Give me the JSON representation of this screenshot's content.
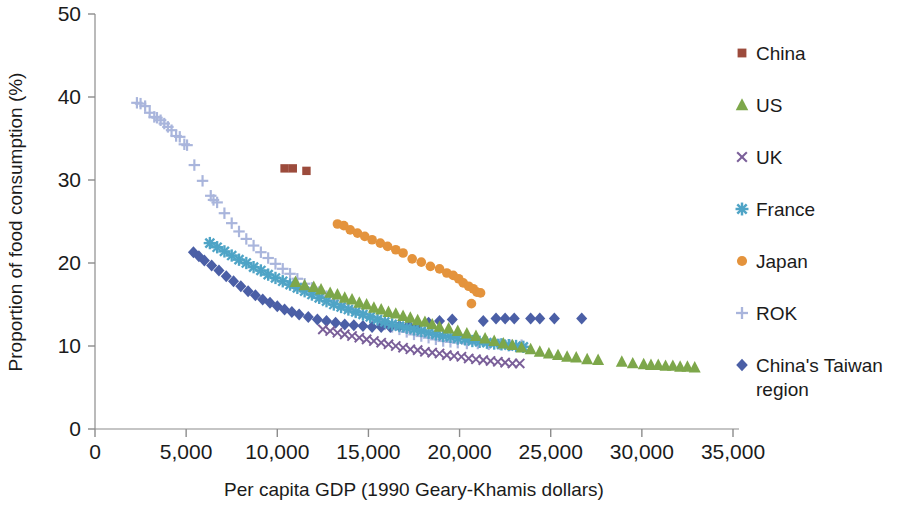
{
  "chart_data": {
    "type": "scatter",
    "title": "",
    "xlabel": "Per capita GDP (1990 Geary-Khamis dollars)",
    "ylabel": "Proportion of food consumption (%)",
    "xlim": [
      0,
      35000
    ],
    "ylim": [
      0,
      50
    ],
    "xticks": [
      0,
      5000,
      10000,
      15000,
      20000,
      25000,
      30000,
      35000
    ],
    "xtick_labels": [
      "0",
      "5,000",
      "10,000",
      "15,000",
      "20,000",
      "25,000",
      "30,000",
      "35,000"
    ],
    "yticks": [
      0,
      10,
      20,
      30,
      40,
      50
    ],
    "ytick_labels": [
      "0",
      "10",
      "20",
      "30",
      "40",
      "50"
    ],
    "grid": false,
    "legend_position": "right",
    "series": [
      {
        "name": "China",
        "marker": "square",
        "color": "#9C4B3C",
        "points": [
          [
            10400,
            31.4
          ],
          [
            10850,
            31.4
          ],
          [
            11600,
            31.1
          ]
        ]
      },
      {
        "name": "US",
        "marker": "triangle",
        "color": "#7DA74A",
        "points": [
          [
            11000,
            17.7
          ],
          [
            11500,
            17.3
          ],
          [
            12000,
            17.1
          ],
          [
            12400,
            16.8
          ],
          [
            12900,
            16.4
          ],
          [
            13300,
            16.2
          ],
          [
            13700,
            15.8
          ],
          [
            14100,
            15.6
          ],
          [
            14500,
            15.2
          ],
          [
            14900,
            15.0
          ],
          [
            15300,
            14.6
          ],
          [
            15700,
            14.4
          ],
          [
            16100,
            14.1
          ],
          [
            16500,
            13.9
          ],
          [
            16900,
            13.6
          ],
          [
            17300,
            13.4
          ],
          [
            17700,
            13.1
          ],
          [
            18100,
            12.9
          ],
          [
            18500,
            12.6
          ],
          [
            18900,
            12.3
          ],
          [
            19400,
            12.1
          ],
          [
            19900,
            11.8
          ],
          [
            20400,
            11.5
          ],
          [
            20900,
            11.2
          ],
          [
            21400,
            10.9
          ],
          [
            21900,
            10.6
          ],
          [
            22400,
            10.3
          ],
          [
            22900,
            10.1
          ],
          [
            23400,
            9.8
          ],
          [
            23900,
            9.6
          ],
          [
            24400,
            9.3
          ],
          [
            24900,
            9.1
          ],
          [
            25400,
            8.9
          ],
          [
            25900,
            8.7
          ],
          [
            26400,
            8.6
          ],
          [
            27000,
            8.4
          ],
          [
            27600,
            8.3
          ],
          [
            28900,
            8.1
          ],
          [
            29500,
            7.9
          ],
          [
            30100,
            7.8
          ],
          [
            30500,
            7.7
          ],
          [
            30900,
            7.7
          ],
          [
            31300,
            7.6
          ],
          [
            31700,
            7.6
          ],
          [
            32100,
            7.5
          ],
          [
            32500,
            7.5
          ],
          [
            32900,
            7.4
          ]
        ]
      },
      {
        "name": "UK",
        "marker": "cross",
        "color": "#7A5F99",
        "points": [
          [
            12500,
            12.0
          ],
          [
            12900,
            11.8
          ],
          [
            13300,
            11.6
          ],
          [
            13700,
            11.4
          ],
          [
            14100,
            11.2
          ],
          [
            14500,
            11.0
          ],
          [
            14900,
            10.8
          ],
          [
            15300,
            10.6
          ],
          [
            15700,
            10.4
          ],
          [
            16100,
            10.2
          ],
          [
            16500,
            10.0
          ],
          [
            16900,
            9.8
          ],
          [
            17300,
            9.6
          ],
          [
            17700,
            9.5
          ],
          [
            18100,
            9.3
          ],
          [
            18500,
            9.2
          ],
          [
            18900,
            9.1
          ],
          [
            19300,
            8.9
          ],
          [
            19700,
            8.8
          ],
          [
            20100,
            8.7
          ],
          [
            20500,
            8.5
          ],
          [
            20900,
            8.4
          ],
          [
            21300,
            8.3
          ],
          [
            21700,
            8.2
          ],
          [
            22100,
            8.1
          ],
          [
            22500,
            8.0
          ],
          [
            22900,
            7.9
          ],
          [
            23300,
            7.9
          ]
        ]
      },
      {
        "name": "France",
        "marker": "asterisk",
        "color": "#4FA4C6",
        "points": [
          [
            6300,
            22.4
          ],
          [
            6700,
            21.9
          ],
          [
            7100,
            21.4
          ],
          [
            7500,
            20.9
          ],
          [
            7900,
            20.4
          ],
          [
            8300,
            20.0
          ],
          [
            8700,
            19.5
          ],
          [
            9100,
            19.1
          ],
          [
            9500,
            18.6
          ],
          [
            9900,
            18.2
          ],
          [
            10300,
            17.8
          ],
          [
            10700,
            17.4
          ],
          [
            11100,
            17.0
          ],
          [
            11500,
            16.6
          ],
          [
            11900,
            16.2
          ],
          [
            12300,
            15.8
          ],
          [
            12700,
            15.4
          ],
          [
            13100,
            15.0
          ],
          [
            13500,
            14.7
          ],
          [
            13900,
            14.4
          ],
          [
            14300,
            14.1
          ],
          [
            14700,
            13.8
          ],
          [
            15100,
            13.5
          ],
          [
            15500,
            13.2
          ],
          [
            15900,
            12.9
          ],
          [
            16300,
            12.6
          ],
          [
            16700,
            12.4
          ],
          [
            17100,
            12.2
          ],
          [
            17500,
            12.0
          ],
          [
            17900,
            11.8
          ],
          [
            18300,
            11.6
          ],
          [
            18700,
            11.4
          ],
          [
            19100,
            11.2
          ],
          [
            19500,
            11.1
          ],
          [
            19900,
            10.9
          ],
          [
            20300,
            10.8
          ],
          [
            20700,
            10.6
          ],
          [
            21100,
            10.5
          ],
          [
            21500,
            10.4
          ],
          [
            21900,
            10.3
          ],
          [
            22300,
            10.2
          ],
          [
            22700,
            10.1
          ],
          [
            23100,
            10.0
          ],
          [
            23500,
            9.9
          ]
        ]
      },
      {
        "name": "Japan",
        "marker": "circle",
        "color": "#E4933C",
        "points": [
          [
            13300,
            24.7
          ],
          [
            13650,
            24.5
          ],
          [
            14000,
            24.0
          ],
          [
            14400,
            23.6
          ],
          [
            14800,
            23.2
          ],
          [
            15200,
            22.8
          ],
          [
            15650,
            22.4
          ],
          [
            16050,
            22.0
          ],
          [
            16500,
            21.6
          ],
          [
            16900,
            21.2
          ],
          [
            17400,
            20.5
          ],
          [
            17900,
            20.1
          ],
          [
            18400,
            19.6
          ],
          [
            18900,
            19.3
          ],
          [
            19300,
            18.8
          ],
          [
            19650,
            18.5
          ],
          [
            19950,
            18.1
          ],
          [
            20200,
            17.6
          ],
          [
            20500,
            17.2
          ],
          [
            20750,
            16.9
          ],
          [
            20950,
            16.5
          ],
          [
            21150,
            16.4
          ],
          [
            20650,
            15.1
          ]
        ]
      },
      {
        "name": "ROK",
        "marker": "plus",
        "color": "#A9B5DC",
        "points": [
          [
            2300,
            39.3
          ],
          [
            2500,
            39.2
          ],
          [
            2750,
            38.9
          ],
          [
            3000,
            38.1
          ],
          [
            3250,
            37.6
          ],
          [
            3400,
            37.5
          ],
          [
            3600,
            37.2
          ],
          [
            3800,
            36.8
          ],
          [
            4000,
            36.4
          ],
          [
            4200,
            36.0
          ],
          [
            4450,
            35.3
          ],
          [
            4650,
            35.2
          ],
          [
            4900,
            34.3
          ],
          [
            5050,
            34.2
          ],
          [
            5450,
            31.8
          ],
          [
            5900,
            29.9
          ],
          [
            6350,
            28.1
          ],
          [
            6500,
            27.6
          ],
          [
            6700,
            27.3
          ],
          [
            7100,
            26.0
          ],
          [
            7500,
            24.8
          ],
          [
            7900,
            23.8
          ],
          [
            8300,
            22.9
          ],
          [
            8700,
            22.1
          ],
          [
            9100,
            21.3
          ],
          [
            9500,
            20.6
          ],
          [
            9900,
            19.9
          ],
          [
            10300,
            19.3
          ],
          [
            10700,
            18.7
          ],
          [
            11100,
            18.1
          ],
          [
            11500,
            17.5
          ],
          [
            11900,
            17.0
          ],
          [
            12300,
            16.5
          ],
          [
            12700,
            16.0
          ],
          [
            13100,
            15.5
          ],
          [
            13500,
            15.1
          ],
          [
            13900,
            14.6
          ],
          [
            14300,
            14.2
          ],
          [
            14700,
            13.8
          ],
          [
            15100,
            13.4
          ],
          [
            15500,
            13.0
          ],
          [
            15900,
            12.6
          ],
          [
            16300,
            12.3
          ],
          [
            16700,
            12.0
          ],
          [
            17100,
            11.7
          ],
          [
            17500,
            11.4
          ],
          [
            17900,
            11.2
          ],
          [
            18300,
            11.0
          ],
          [
            18700,
            10.8
          ],
          [
            19100,
            10.6
          ],
          [
            19500,
            10.5
          ],
          [
            19900,
            10.4
          ],
          [
            20400,
            10.3
          ],
          [
            21000,
            10.3
          ],
          [
            21600,
            10.2
          ],
          [
            22200,
            10.2
          ],
          [
            22800,
            10.1
          ],
          [
            23400,
            10.1
          ]
        ]
      },
      {
        "name": "China's Taiwan region",
        "marker": "diamond",
        "color": "#4B5FA6",
        "points": [
          [
            5400,
            21.3
          ],
          [
            5700,
            20.8
          ],
          [
            6000,
            20.3
          ],
          [
            6400,
            19.7
          ],
          [
            6800,
            19.1
          ],
          [
            7200,
            18.4
          ],
          [
            7600,
            17.8
          ],
          [
            8000,
            17.2
          ],
          [
            8400,
            16.6
          ],
          [
            8800,
            16.1
          ],
          [
            9200,
            15.6
          ],
          [
            9600,
            15.2
          ],
          [
            10000,
            14.8
          ],
          [
            10400,
            14.4
          ],
          [
            10800,
            14.1
          ],
          [
            11200,
            13.8
          ],
          [
            11700,
            13.5
          ],
          [
            12200,
            13.2
          ],
          [
            12700,
            13.0
          ],
          [
            13200,
            12.8
          ],
          [
            13700,
            12.6
          ],
          [
            14200,
            12.5
          ],
          [
            14700,
            12.4
          ],
          [
            15200,
            12.3
          ],
          [
            15700,
            12.3
          ],
          [
            16200,
            12.3
          ],
          [
            16700,
            12.4
          ],
          [
            17200,
            12.5
          ],
          [
            17700,
            12.6
          ],
          [
            18300,
            12.8
          ],
          [
            18900,
            13.0
          ],
          [
            19600,
            13.2
          ],
          [
            21300,
            13.0
          ],
          [
            22000,
            13.3
          ],
          [
            22500,
            13.3
          ],
          [
            23000,
            13.3
          ],
          [
            23900,
            13.3
          ],
          [
            24400,
            13.3
          ],
          [
            25200,
            13.3
          ],
          [
            26700,
            13.3
          ]
        ]
      }
    ]
  },
  "legend": {
    "items": [
      {
        "label": "China",
        "marker": "square",
        "color": "#9C4B3C"
      },
      {
        "label": "US",
        "marker": "triangle",
        "color": "#7DA74A"
      },
      {
        "label": "UK",
        "marker": "cross",
        "color": "#7A5F99"
      },
      {
        "label": "France",
        "marker": "asterisk",
        "color": "#4FA4C6"
      },
      {
        "label": "Japan",
        "marker": "circle",
        "color": "#E4933C"
      },
      {
        "label": "ROK",
        "marker": "plus",
        "color": "#A9B5DC"
      },
      {
        "label": "China's Taiwan region",
        "marker": "diamond",
        "color": "#4B5FA6"
      }
    ]
  },
  "axes": {
    "x_title": "Per capita GDP (1990 Geary-Khamis dollars)",
    "y_title": "Proportion of food consumption (%)",
    "axis_color": "#8c8c8c"
  }
}
